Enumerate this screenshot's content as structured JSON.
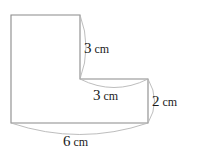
{
  "figure": {
    "background_color": "#ffffff",
    "outline_color": "#8a8a8a",
    "arc_color": "#b5b5b5",
    "label_color": "#1a1a1a",
    "shape": {
      "name": "l-shape-polygon",
      "points": "11,15 80,15 80,79 148,79 148,123 11,123"
    },
    "dimensions": [
      {
        "id": "right-upper-vertical",
        "value": "3",
        "unit": "cm",
        "full_text": "3 cm",
        "orientation": "vertical",
        "arc_path": "M 80,15 Q 92,47 80,79",
        "label_x": 84,
        "label_y": 53
      },
      {
        "id": "inner-horizontal",
        "value": "3",
        "unit": "cm",
        "full_text": "3 cm",
        "orientation": "horizontal",
        "arc_path": "M 80,79 Q 114,96 148,79",
        "label_x": 93,
        "label_y": 100
      },
      {
        "id": "right-lower-vertical",
        "value": "2",
        "unit": "cm",
        "full_text": "2 cm",
        "orientation": "vertical",
        "arc_path": "M 148,79 Q 161,101 148,123",
        "label_x": 152,
        "label_y": 106
      },
      {
        "id": "bottom-horizontal",
        "value": "6",
        "unit": "cm",
        "full_text": "6 cm",
        "orientation": "horizontal",
        "arc_path": "M 11,123 Q 80,146 148,123",
        "label_x": 63,
        "label_y": 146
      }
    ]
  }
}
